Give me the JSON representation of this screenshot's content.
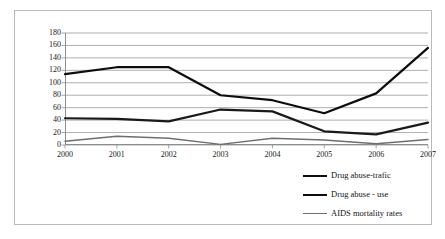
{
  "chart_data": {
    "type": "line",
    "title": "",
    "xlabel": "",
    "ylabel": "",
    "categories": [
      "2000",
      "2001",
      "2002",
      "2003",
      "2004",
      "2005",
      "2006",
      "2007"
    ],
    "ylim": [
      0,
      180
    ],
    "yticks": [
      0,
      20,
      40,
      60,
      80,
      100,
      120,
      140,
      160,
      180
    ],
    "grid": true,
    "legend_position": "bottom-right",
    "series": [
      {
        "name": "Drug abuse-trafic",
        "color": "#0d0d0d",
        "values": [
          114,
          125,
          125,
          80,
          72,
          51,
          83,
          156
        ]
      },
      {
        "name": "Drug abuse - use",
        "color": "#1a1a1a",
        "values": [
          43,
          42,
          38,
          57,
          54,
          22,
          17,
          36
        ]
      },
      {
        "name": "AIDS mortality rates",
        "color": "#6e6e6e",
        "values": [
          6,
          14,
          11,
          1,
          11,
          8,
          2,
          9
        ]
      }
    ]
  },
  "axis": {
    "y_tick_labels": [
      "180",
      "160",
      "140",
      "120",
      "100",
      "80",
      "60",
      "40",
      "20",
      "0"
    ],
    "x_tick_labels": [
      "2000",
      "2001",
      "2002",
      "2003",
      "2004",
      "2005",
      "2006",
      "2007"
    ]
  },
  "legend": {
    "items": [
      {
        "label": "Drug abuse-trafic",
        "swatch": "thick-line-swatch"
      },
      {
        "label": "Drug abuse - use",
        "swatch": "thick-line-swatch"
      },
      {
        "label": "AIDS mortality rates",
        "swatch": "thin-line-swatch"
      }
    ]
  },
  "colors": {
    "grid": "#9a9a9a",
    "axis": "#8d8d8d",
    "frame": "#b9b9b9",
    "background": "#ffffff",
    "text": "#1a1a1a"
  }
}
